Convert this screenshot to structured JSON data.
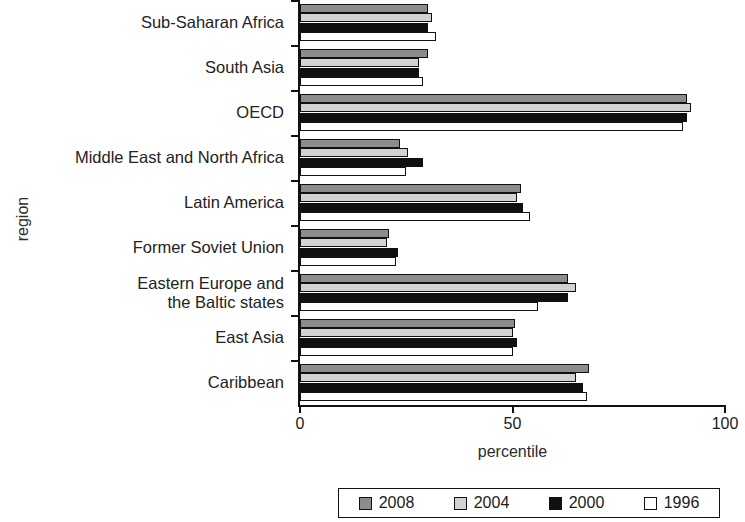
{
  "chart_data": {
    "type": "bar",
    "orientation": "horizontal",
    "title": "",
    "xlabel": "percentile",
    "ylabel": "region",
    "xlim": [
      0,
      100
    ],
    "xticks": [
      0,
      50,
      100
    ],
    "xtick_labels": [
      "0",
      "50",
      "100"
    ],
    "grid": false,
    "legend_position": "bottom",
    "categories": [
      "Caribbean",
      "East Asia",
      "Eastern Europe and\nthe Baltic states",
      "Former Soviet Union",
      "Latin America",
      "Middle East and North Africa",
      "OECD",
      "South Asia",
      "Sub-Saharan Africa"
    ],
    "series": [
      {
        "name": "2008",
        "color": "#8c8c8c",
        "values": [
          68,
          50.5,
          63,
          21,
          52,
          23.5,
          91,
          30,
          30
        ]
      },
      {
        "name": "2004",
        "color": "#d2d2d2",
        "values": [
          65,
          50,
          65,
          20.5,
          51,
          25.5,
          92,
          28,
          31
        ]
      },
      {
        "name": "2000",
        "color": "#101010",
        "values": [
          66.5,
          51,
          63,
          23,
          52.5,
          29,
          91,
          28,
          30
        ]
      },
      {
        "name": "1996",
        "color": "#ffffff",
        "values": [
          67.5,
          50,
          56,
          22.5,
          54,
          25,
          90,
          29,
          32
        ]
      }
    ]
  },
  "legend": {
    "items": [
      {
        "label": "2008",
        "color": "#8c8c8c"
      },
      {
        "label": "2004",
        "color": "#d2d2d2"
      },
      {
        "label": "2000",
        "color": "#101010"
      },
      {
        "label": "1996",
        "color": "#ffffff"
      }
    ]
  }
}
